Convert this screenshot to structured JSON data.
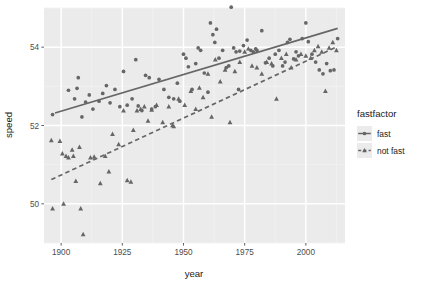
{
  "chart_data": {
    "type": "scatter",
    "title": "",
    "xlabel": "year",
    "ylabel": "speed",
    "xlim": [
      1893,
      2016
    ],
    "ylim": [
      49.0,
      55.0
    ],
    "xticks": [
      1900,
      1925,
      1950,
      1975,
      2000
    ],
    "xticklabels": [
      "1900",
      "1925",
      "1950",
      "1975",
      "2000"
    ],
    "yticks": [
      50,
      52,
      54
    ],
    "yticklabels": [
      "50",
      "52",
      "54"
    ],
    "grid": true,
    "grid_major_color": "#ffffff",
    "grid_minor_color": "#f2f2f2",
    "panel_background": "#ebebeb",
    "legend": {
      "title": "fastfactor",
      "position": "right",
      "entries": [
        {
          "label": "fast",
          "shape": "circle",
          "linetype": "solid",
          "color": "#666666"
        },
        {
          "label": "not fast",
          "shape": "triangle",
          "linetype": "dashed",
          "color": "#666666"
        }
      ]
    },
    "series": [
      {
        "name": "fast",
        "shape": "circle",
        "linetype": "solid",
        "color": "#666666",
        "fit_line": {
          "x": [
            1897.5,
            2013.0
          ],
          "y": [
            52.32,
            54.48
          ]
        },
        "points": [
          {
            "x": 1896.5,
            "y": 52.28
          },
          {
            "x": 1903.0,
            "y": 52.9
          },
          {
            "x": 1905.5,
            "y": 52.68
          },
          {
            "x": 1906.5,
            "y": 52.95
          },
          {
            "x": 1907.0,
            "y": 53.22
          },
          {
            "x": 1908.5,
            "y": 52.22
          },
          {
            "x": 1910.0,
            "y": 52.6
          },
          {
            "x": 1911.5,
            "y": 52.78
          },
          {
            "x": 1913.0,
            "y": 52.42
          },
          {
            "x": 1915.5,
            "y": 52.62
          },
          {
            "x": 1917.0,
            "y": 52.82
          },
          {
            "x": 1918.5,
            "y": 53.02
          },
          {
            "x": 1920.0,
            "y": 52.58
          },
          {
            "x": 1922.0,
            "y": 52.92
          },
          {
            "x": 1924.0,
            "y": 52.48
          },
          {
            "x": 1925.5,
            "y": 53.38
          },
          {
            "x": 1927.0,
            "y": 52.52
          },
          {
            "x": 1929.0,
            "y": 52.68
          },
          {
            "x": 1930.5,
            "y": 53.68
          },
          {
            "x": 1931.5,
            "y": 52.5
          },
          {
            "x": 1933.0,
            "y": 52.38
          },
          {
            "x": 1934.5,
            "y": 53.28
          },
          {
            "x": 1936.0,
            "y": 53.22
          },
          {
            "x": 1937.0,
            "y": 52.42
          },
          {
            "x": 1938.5,
            "y": 52.48
          },
          {
            "x": 1940.0,
            "y": 53.18
          },
          {
            "x": 1942.0,
            "y": 52.92
          },
          {
            "x": 1944.0,
            "y": 52.72
          },
          {
            "x": 1946.0,
            "y": 52.68
          },
          {
            "x": 1947.5,
            "y": 53.08
          },
          {
            "x": 1948.5,
            "y": 52.62
          },
          {
            "x": 1950.0,
            "y": 53.82
          },
          {
            "x": 1951.0,
            "y": 53.72
          },
          {
            "x": 1952.0,
            "y": 53.5
          },
          {
            "x": 1953.5,
            "y": 52.92
          },
          {
            "x": 1955.0,
            "y": 53.58
          },
          {
            "x": 1956.0,
            "y": 53.98
          },
          {
            "x": 1957.0,
            "y": 53.92
          },
          {
            "x": 1958.5,
            "y": 53.34
          },
          {
            "x": 1960.0,
            "y": 52.85
          },
          {
            "x": 1961.0,
            "y": 54.62
          },
          {
            "x": 1962.0,
            "y": 54.32
          },
          {
            "x": 1962.8,
            "y": 54.12
          },
          {
            "x": 1963.5,
            "y": 54.46
          },
          {
            "x": 1964.5,
            "y": 53.72
          },
          {
            "x": 1966.0,
            "y": 53.92
          },
          {
            "x": 1967.5,
            "y": 53.48
          },
          {
            "x": 1968.5,
            "y": 53.52
          },
          {
            "x": 1969.5,
            "y": 55.02
          },
          {
            "x": 1970.5,
            "y": 53.98
          },
          {
            "x": 1971.5,
            "y": 53.88
          },
          {
            "x": 1972.5,
            "y": 52.92
          },
          {
            "x": 1973.0,
            "y": 53.9
          },
          {
            "x": 1974.5,
            "y": 54.04
          },
          {
            "x": 1976.0,
            "y": 54.18
          },
          {
            "x": 1977.5,
            "y": 53.92
          },
          {
            "x": 1978.5,
            "y": 53.88
          },
          {
            "x": 1979.5,
            "y": 53.96
          },
          {
            "x": 1980.0,
            "y": 53.92
          },
          {
            "x": 1982.0,
            "y": 54.42
          },
          {
            "x": 1983.5,
            "y": 53.6
          },
          {
            "x": 1985.0,
            "y": 53.72
          },
          {
            "x": 1986.5,
            "y": 53.52
          },
          {
            "x": 1987.5,
            "y": 53.82
          },
          {
            "x": 1989.0,
            "y": 53.92
          },
          {
            "x": 1990.5,
            "y": 53.52
          },
          {
            "x": 1991.5,
            "y": 53.62
          },
          {
            "x": 1992.5,
            "y": 54.12
          },
          {
            "x": 1993.5,
            "y": 54.2
          },
          {
            "x": 1995.0,
            "y": 53.7
          },
          {
            "x": 1996.0,
            "y": 53.88
          },
          {
            "x": 1997.0,
            "y": 53.78
          },
          {
            "x": 1998.5,
            "y": 54.22
          },
          {
            "x": 2000.0,
            "y": 54.62
          },
          {
            "x": 2001.0,
            "y": 54.14
          },
          {
            "x": 2002.5,
            "y": 53.82
          },
          {
            "x": 2004.0,
            "y": 53.62
          },
          {
            "x": 2005.5,
            "y": 53.42
          },
          {
            "x": 2007.0,
            "y": 53.32
          },
          {
            "x": 2008.5,
            "y": 53.58
          },
          {
            "x": 2010.0,
            "y": 53.4
          },
          {
            "x": 2011.5,
            "y": 53.42
          },
          {
            "x": 2013.0,
            "y": 54.22
          }
        ]
      },
      {
        "name": "not fast",
        "shape": "triangle",
        "linetype": "dashed",
        "color": "#666666",
        "fit_line": {
          "x": [
            1896.0,
            2013.0
          ],
          "y": [
            50.62,
            54.02
          ]
        },
        "points": [
          {
            "x": 1896.0,
            "y": 51.62
          },
          {
            "x": 1896.5,
            "y": 49.88
          },
          {
            "x": 1899.5,
            "y": 51.6
          },
          {
            "x": 1900.5,
            "y": 51.28
          },
          {
            "x": 1901.0,
            "y": 50.0
          },
          {
            "x": 1902.0,
            "y": 51.22
          },
          {
            "x": 1903.0,
            "y": 51.18
          },
          {
            "x": 1904.5,
            "y": 51.38
          },
          {
            "x": 1905.0,
            "y": 51.22
          },
          {
            "x": 1906.0,
            "y": 50.58
          },
          {
            "x": 1907.5,
            "y": 51.45
          },
          {
            "x": 1908.0,
            "y": 49.88
          },
          {
            "x": 1909.0,
            "y": 49.22
          },
          {
            "x": 1912.0,
            "y": 51.18
          },
          {
            "x": 1913.5,
            "y": 51.2
          },
          {
            "x": 1916.0,
            "y": 50.52
          },
          {
            "x": 1918.0,
            "y": 51.22
          },
          {
            "x": 1919.5,
            "y": 50.82
          },
          {
            "x": 1921.0,
            "y": 51.78
          },
          {
            "x": 1923.5,
            "y": 51.52
          },
          {
            "x": 1925.5,
            "y": 52.38
          },
          {
            "x": 1927.0,
            "y": 50.6
          },
          {
            "x": 1928.5,
            "y": 50.56
          },
          {
            "x": 1929.5,
            "y": 51.88
          },
          {
            "x": 1931.0,
            "y": 52.38
          },
          {
            "x": 1932.5,
            "y": 52.42
          },
          {
            "x": 1934.0,
            "y": 52.48
          },
          {
            "x": 1935.5,
            "y": 52.12
          },
          {
            "x": 1937.0,
            "y": 52.4
          },
          {
            "x": 1939.0,
            "y": 52.52
          },
          {
            "x": 1941.5,
            "y": 52.08
          },
          {
            "x": 1944.0,
            "y": 52.48
          },
          {
            "x": 1945.5,
            "y": 52.0
          },
          {
            "x": 1946.0,
            "y": 51.98
          },
          {
            "x": 1948.0,
            "y": 52.68
          },
          {
            "x": 1950.5,
            "y": 52.52
          },
          {
            "x": 1953.0,
            "y": 52.88
          },
          {
            "x": 1955.0,
            "y": 52.42
          },
          {
            "x": 1956.5,
            "y": 52.96
          },
          {
            "x": 1958.0,
            "y": 52.72
          },
          {
            "x": 1960.0,
            "y": 53.32
          },
          {
            "x": 1961.5,
            "y": 52.22
          },
          {
            "x": 1963.0,
            "y": 53.68
          },
          {
            "x": 1965.0,
            "y": 53.12
          },
          {
            "x": 1967.0,
            "y": 53.42
          },
          {
            "x": 1969.0,
            "y": 52.08
          },
          {
            "x": 1971.0,
            "y": 53.38
          },
          {
            "x": 1973.0,
            "y": 53.62
          },
          {
            "x": 1975.0,
            "y": 53.88
          },
          {
            "x": 1976.5,
            "y": 53.96
          },
          {
            "x": 1978.0,
            "y": 53.52
          },
          {
            "x": 1980.0,
            "y": 53.48
          },
          {
            "x": 1982.0,
            "y": 53.32
          },
          {
            "x": 1984.0,
            "y": 53.62
          },
          {
            "x": 1986.0,
            "y": 53.58
          },
          {
            "x": 1988.0,
            "y": 52.68
          },
          {
            "x": 1990.0,
            "y": 53.72
          },
          {
            "x": 1992.0,
            "y": 53.82
          },
          {
            "x": 1994.0,
            "y": 53.48
          },
          {
            "x": 1996.0,
            "y": 53.68
          },
          {
            "x": 1998.0,
            "y": 53.82
          },
          {
            "x": 2000.0,
            "y": 53.78
          },
          {
            "x": 2002.0,
            "y": 53.72
          },
          {
            "x": 2003.5,
            "y": 53.92
          },
          {
            "x": 2005.0,
            "y": 54.02
          },
          {
            "x": 2006.5,
            "y": 53.88
          },
          {
            "x": 2008.0,
            "y": 52.88
          },
          {
            "x": 2009.5,
            "y": 53.98
          },
          {
            "x": 2011.0,
            "y": 54.12
          },
          {
            "x": 2012.5,
            "y": 53.92
          }
        ]
      }
    ]
  }
}
